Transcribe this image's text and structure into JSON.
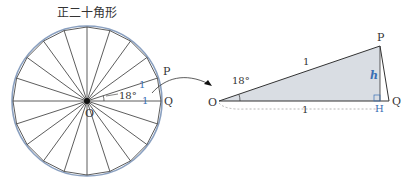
{
  "title": "正二十角形",
  "left_figure": {
    "center_label": "O",
    "point_p_label": "P",
    "point_q_label": "Q",
    "side_op_label": "1",
    "side_oq_label": "1",
    "angle_label": "18°",
    "polygon_sides": 20
  },
  "right_figure": {
    "o_label": "O",
    "p_label": "P",
    "q_label": "Q",
    "h_label": "H",
    "height_label": "h",
    "hyp_label": "1",
    "base_label": "1",
    "angle_label": "18°"
  },
  "colors": {
    "line": "#333333",
    "blue": "#3a6fb5",
    "circle": "#8aa0c0",
    "fill": "#d9dde3"
  }
}
